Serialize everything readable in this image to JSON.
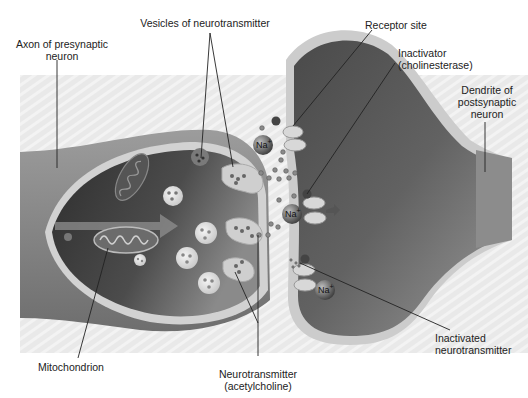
{
  "diagram": {
    "labels": {
      "axon": [
        "Axon of presynaptic",
        "neuron"
      ],
      "vesicles": "Vesicles of neurotransmitter",
      "receptor": "Receptor site",
      "inactivator": [
        "Inactivator",
        "(cholinesterase)"
      ],
      "dendrite": [
        "Dendrite of",
        "postsynaptic",
        "neuron"
      ],
      "mitochondrion": "Mitochondrion",
      "neurotransmitter": [
        "Neurotransmitter",
        "(acetylcholine)"
      ],
      "inactivated": [
        "Inactivated",
        "neurotransmitter"
      ]
    },
    "ions": {
      "symbol": "Na",
      "charge": "+",
      "count": 3
    },
    "colors": {
      "background_band": "#e6e6e6",
      "membrane": "#c8c8c8",
      "presynaptic_dark": "#4a4a4a",
      "postsynaptic_dark": "#5a5a5a",
      "leader_line": "#222222"
    }
  }
}
